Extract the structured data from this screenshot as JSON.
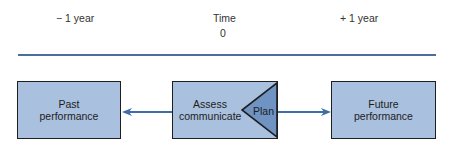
{
  "timeline": {
    "left_label": "− 1 year",
    "center_label": "Time",
    "center_value": "0",
    "right_label": "+ 1 year"
  },
  "boxes": {
    "past": {
      "line1": "Past",
      "line2": "performance"
    },
    "center": {
      "line1": "Assess",
      "line2": "communicate",
      "plan": "Plan"
    },
    "future": {
      "line1": "Future",
      "line2": "performance"
    }
  },
  "colors": {
    "box_fill": "#a9c0de",
    "plan_fill": "#6f94c4",
    "line": "#4a6f9e",
    "arrow": "#3f6da6"
  }
}
